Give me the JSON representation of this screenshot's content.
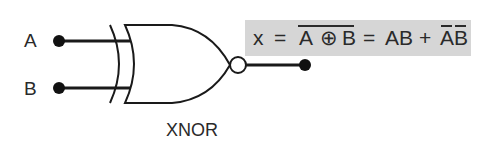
{
  "gate": {
    "type": "XNOR",
    "caption": "XNOR",
    "inputs": [
      {
        "label": "A"
      },
      {
        "label": "B"
      }
    ],
    "output": {
      "label": "x"
    }
  },
  "formula": {
    "lhs": "x",
    "eq1": "=",
    "xor_a": "A",
    "xor_op": "⊕",
    "xor_b": "B",
    "eq2": "=",
    "term1": "AB",
    "plus": "+",
    "term2_a": "A",
    "term2_b": "B",
    "background": "#d6d6d6",
    "overlines": [
      "A ⊕ B (entire expression)",
      "A (in second term)",
      "B (in second term)"
    ]
  },
  "colors": {
    "stroke": "#1a1a1a",
    "text": "#2a2a2a",
    "background": "#ffffff"
  }
}
